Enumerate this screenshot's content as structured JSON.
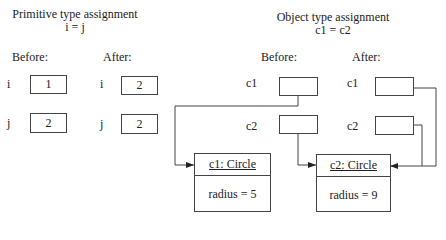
{
  "primitive": {
    "title": "Primitive type assignment",
    "expression": "i = j",
    "before_label": "Before:",
    "after_label": "After:",
    "before": [
      {
        "var": "i",
        "value": "1"
      },
      {
        "var": "j",
        "value": "2"
      }
    ],
    "after": [
      {
        "var": "i",
        "value": "2"
      },
      {
        "var": "j",
        "value": "2"
      }
    ]
  },
  "object": {
    "title": "Object type assignment",
    "expression": "c1 = c2",
    "before_label": "Before:",
    "after_label": "After:",
    "before": [
      {
        "var": "c1"
      },
      {
        "var": "c2"
      }
    ],
    "after": [
      {
        "var": "c1"
      },
      {
        "var": "c2"
      }
    ],
    "instances": [
      {
        "name": "c1: Circle",
        "field": "radius = 5"
      },
      {
        "name": "c2: Circle",
        "field": "radius = 9"
      }
    ]
  }
}
